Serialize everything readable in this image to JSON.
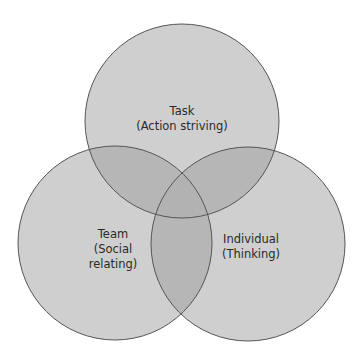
{
  "diagram": {
    "type": "venn",
    "colors": {
      "background": "#ffffff",
      "single": "#cfcfcf",
      "pair": "#b6b6b6",
      "triple": "#b2b2b2",
      "stroke": "#555555"
    },
    "circles": [
      {
        "id": "task",
        "title": "Task",
        "subtitle": "(Action striving)",
        "cx": 182,
        "cy": 121,
        "r": 97
      },
      {
        "id": "team",
        "title": "Team",
        "subtitle_line1": "(Social",
        "subtitle_line2": "relating)",
        "cx": 115,
        "cy": 243,
        "r": 97
      },
      {
        "id": "individual",
        "title": "Individual",
        "subtitle": "(Thinking)",
        "cx": 248,
        "cy": 244,
        "r": 97
      }
    ]
  }
}
